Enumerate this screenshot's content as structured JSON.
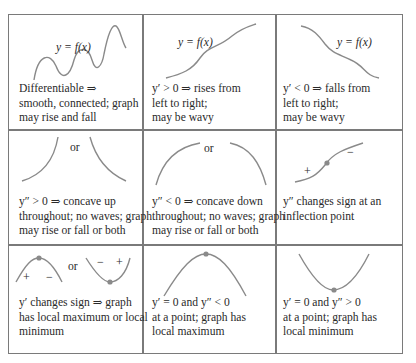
{
  "figure": {
    "title": "",
    "curve_color": "#8a8a8a",
    "point_color": "#8a8a8a",
    "border_color": "#7a7a7a",
    "cells": [
      {
        "id": "differentiable",
        "graph_label": "y = f(x)",
        "caption": [
          "Differentiable ⇒",
          "smooth, connected; graph",
          "may rise and fall"
        ]
      },
      {
        "id": "increasing",
        "graph_label": "y = f(x)",
        "caption": [
          "y′ > 0 ⇒ rises from",
          "left to right;",
          "may be wavy"
        ]
      },
      {
        "id": "decreasing",
        "graph_label": "y = f(x)",
        "caption": [
          "y′ < 0 ⇒ falls from",
          "left to right;",
          "may be wavy"
        ]
      },
      {
        "id": "concave-up",
        "or_label": "or",
        "caption": [
          "y″ > 0 ⇒ concave up",
          "throughout; no waves; graph",
          "may rise or fall or both"
        ]
      },
      {
        "id": "concave-down",
        "or_label": "or",
        "caption": [
          "y″ < 0 ⇒ concave down",
          "throughout; no waves; graph",
          "may rise or fall or both"
        ]
      },
      {
        "id": "inflection",
        "signs": [
          "+",
          "−"
        ],
        "caption": [
          "y″ changes sign at an",
          "inflection point"
        ]
      },
      {
        "id": "local-extremum",
        "or_label": "or",
        "signs_left": [
          "+",
          "−"
        ],
        "signs_right": [
          "−",
          "+"
        ],
        "caption": [
          "y′ changes sign ⇒ graph",
          "has local maximum or local",
          "minimum"
        ]
      },
      {
        "id": "local-max",
        "caption": [
          "y′ = 0  and  y″ < 0",
          "at a point; graph has",
          "local maximum"
        ]
      },
      {
        "id": "local-min",
        "caption": [
          "y′ = 0  and  y″ > 0",
          "at a point; graph has",
          "local minimum"
        ]
      }
    ]
  }
}
